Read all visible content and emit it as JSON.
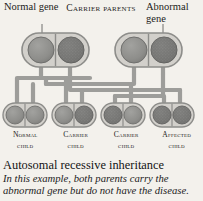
{
  "diagram": {
    "title": "Autosomal recessive inheritance",
    "caption": "In this example, both parents carry the abnormal gene but do not have the disease.",
    "annotations": {
      "normal_gene": "Normal gene",
      "abnormal_gene": "Abnormal gene",
      "parents_header": "Carrier parents"
    },
    "colors": {
      "background": "#f3f1ec",
      "capsule_fill": "#d2d0cb",
      "capsule_stroke": "#8d8d8a",
      "gene_normal": "#8e8e8b",
      "gene_abnormal": "#6f6f6d",
      "connector": "#9b9b98",
      "text": "#1d1d1b"
    },
    "parents": [
      {
        "name": "mother",
        "genotype": "carrier",
        "genes": [
          {
            "allele": "normal",
            "texture": "plain"
          },
          {
            "allele": "abnormal",
            "texture": "speckled"
          }
        ]
      },
      {
        "name": "father",
        "genotype": "carrier",
        "genes": [
          {
            "allele": "normal",
            "texture": "plain"
          },
          {
            "allele": "abnormal",
            "texture": "speckled"
          }
        ]
      }
    ],
    "children": [
      {
        "label_line1": "Normal",
        "label_line2": "child",
        "genotype": "normal",
        "genes": [
          {
            "allele": "normal",
            "texture": "plain"
          },
          {
            "allele": "normal",
            "texture": "plain"
          }
        ]
      },
      {
        "label_line1": "Carrier",
        "label_line2": "child",
        "genotype": "carrier",
        "genes": [
          {
            "allele": "normal",
            "texture": "plain"
          },
          {
            "allele": "abnormal",
            "texture": "speckled"
          }
        ]
      },
      {
        "label_line1": "Carrier",
        "label_line2": "child",
        "genotype": "carrier",
        "genes": [
          {
            "allele": "abnormal",
            "texture": "speckled"
          },
          {
            "allele": "normal",
            "texture": "plain"
          }
        ]
      },
      {
        "label_line1": "Affected",
        "label_line2": "child",
        "genotype": "affected",
        "genes": [
          {
            "allele": "abnormal",
            "texture": "speckled"
          },
          {
            "allele": "abnormal",
            "texture": "speckled"
          }
        ]
      }
    ]
  }
}
